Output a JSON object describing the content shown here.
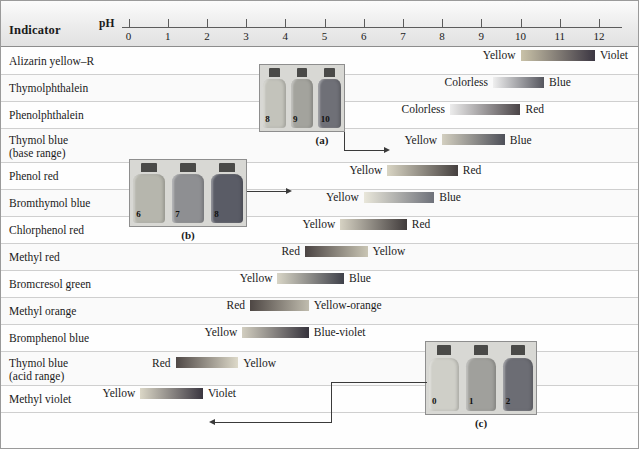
{
  "header": {
    "indicator_column_label": "Indicator",
    "ph_label": "pH"
  },
  "chart_data": {
    "type": "bar",
    "xlabel": "pH",
    "ylabel": "Indicator",
    "xlim": [
      0,
      12
    ],
    "grid": false,
    "legend": null,
    "axis_ticks": [
      "0",
      "1",
      "2",
      "3",
      "4",
      "5",
      "6",
      "7",
      "8",
      "9",
      "10",
      "11",
      "12"
    ],
    "categories": [
      "Alizarin yellow–R",
      "Thymolphthalein",
      "Phenolphthalein",
      "Thymol blue (base range)",
      "Phenol red",
      "Bromthymol blue",
      "Chlorphenol red",
      "Methyl red",
      "Bromcresol green",
      "Methyl orange",
      "Bromphenol blue",
      "Thymol blue (acid range)",
      "Methyl violet"
    ],
    "series": [
      {
        "name": "transition range",
        "ranges": [
          {
            "indicator": "Alizarin yellow–R",
            "ph_low": 10.0,
            "ph_high": 11.9,
            "acid_color": "Yellow",
            "base_color": "Violet"
          },
          {
            "indicator": "Thymolphthalein",
            "ph_low": 9.3,
            "ph_high": 10.6,
            "acid_color": "Colorless",
            "base_color": "Blue"
          },
          {
            "indicator": "Phenolphthalein",
            "ph_low": 8.2,
            "ph_high": 10.0,
            "acid_color": "Colorless",
            "base_color": "Red"
          },
          {
            "indicator": "Thymol blue (base range)",
            "ph_low": 8.0,
            "ph_high": 9.6,
            "acid_color": "Yellow",
            "base_color": "Blue"
          },
          {
            "indicator": "Phenol red",
            "ph_low": 6.6,
            "ph_high": 8.4,
            "acid_color": "Yellow",
            "base_color": "Red"
          },
          {
            "indicator": "Bromthymol blue",
            "ph_low": 6.0,
            "ph_high": 7.8,
            "acid_color": "Yellow",
            "base_color": "Blue"
          },
          {
            "indicator": "Chlorphenol red",
            "ph_low": 5.4,
            "ph_high": 7.1,
            "acid_color": "Yellow",
            "base_color": "Red"
          },
          {
            "indicator": "Methyl red",
            "ph_low": 4.5,
            "ph_high": 6.1,
            "acid_color": "Red",
            "base_color": "Yellow"
          },
          {
            "indicator": "Bromcresol green",
            "ph_low": 3.8,
            "ph_high": 5.5,
            "acid_color": "Yellow",
            "base_color": "Blue"
          },
          {
            "indicator": "Methyl orange",
            "ph_low": 3.1,
            "ph_high": 4.6,
            "acid_color": "Red",
            "base_color": "Yellow-orange"
          },
          {
            "indicator": "Bromphenol blue",
            "ph_low": 2.9,
            "ph_high": 4.6,
            "acid_color": "Yellow",
            "base_color": "Blue-violet"
          },
          {
            "indicator": "Thymol blue (acid range)",
            "ph_low": 1.2,
            "ph_high": 2.8,
            "acid_color": "Red",
            "base_color": "Yellow"
          },
          {
            "indicator": "Methyl violet",
            "ph_low": 0.3,
            "ph_high": 1.9,
            "acid_color": "Yellow",
            "base_color": "Violet"
          }
        ]
      }
    ]
  },
  "rows": [
    {
      "name": "Alizarin yellow–R",
      "name2": "",
      "left_label": "Yellow",
      "right_label": "Violet",
      "low": 10.0,
      "high": 11.9,
      "c1": "#c9c2a8",
      "c2": "#3b3642"
    },
    {
      "name": "Thymolphthalein",
      "name2": "",
      "left_label": "Colorless",
      "right_label": "Blue",
      "low": 9.3,
      "high": 10.6,
      "c1": "#efefef",
      "c2": "#55565e"
    },
    {
      "name": "Phenolphthalein",
      "name2": "",
      "left_label": "Colorless",
      "right_label": "Red",
      "low": 8.2,
      "high": 10.0,
      "c1": "#ececec",
      "c2": "#4a4447"
    },
    {
      "name": "Thymol blue",
      "name2": "(base range)",
      "left_label": "Yellow",
      "right_label": "Blue",
      "low": 8.0,
      "high": 9.6,
      "c1": "#d3cfc0",
      "c2": "#4e5059"
    },
    {
      "name": "Phenol red",
      "name2": "",
      "left_label": "Yellow",
      "right_label": "Red",
      "low": 6.6,
      "high": 8.4,
      "c1": "#d9d5c4",
      "c2": "#45403f"
    },
    {
      "name": "Bromthymol blue",
      "name2": "",
      "left_label": "Yellow",
      "right_label": "Blue",
      "low": 6.0,
      "high": 7.8,
      "c1": "#e9e7da",
      "c2": "#6e717a"
    },
    {
      "name": "Chlorphenol red",
      "name2": "",
      "left_label": "Yellow",
      "right_label": "Red",
      "low": 5.4,
      "high": 7.1,
      "c1": "#d6d2c3",
      "c2": "#403b3b"
    },
    {
      "name": "Methyl red",
      "name2": "",
      "left_label": "Red",
      "right_label": "Yellow",
      "low": 4.5,
      "high": 6.1,
      "c1": "#4b4443",
      "c2": "#c9c5b4"
    },
    {
      "name": "Bromcresol green",
      "name2": "",
      "left_label": "Yellow",
      "right_label": "Blue",
      "low": 3.8,
      "high": 5.5,
      "c1": "#d8d5c6",
      "c2": "#3f414a"
    },
    {
      "name": "Methyl orange",
      "name2": "",
      "left_label": "Red",
      "right_label": "Yellow-orange",
      "low": 3.1,
      "high": 4.6,
      "c1": "#4e4744",
      "c2": "#c0bcae"
    },
    {
      "name": "Bromphenol blue",
      "name2": "",
      "left_label": "Yellow",
      "right_label": "Blue-violet",
      "low": 2.9,
      "high": 4.6,
      "c1": "#d2cec0",
      "c2": "#36333c"
    },
    {
      "name": "Thymol blue",
      "name2": "(acid range)",
      "left_label": "Red",
      "right_label": "Yellow",
      "low": 1.2,
      "high": 2.8,
      "c1": "#4f4846",
      "c2": "#ddd9c9"
    },
    {
      "name": "Methyl violet",
      "name2": "",
      "left_label": "Yellow",
      "right_label": "Violet",
      "low": 0.3,
      "high": 1.9,
      "c1": "#dbd7c7",
      "c2": "#3a3640"
    }
  ],
  "insets": [
    {
      "caption": "(a)",
      "bottles": [
        {
          "label": "8",
          "color": "#c3c3bb"
        },
        {
          "label": "9",
          "color": "#a3a39d"
        },
        {
          "label": "10",
          "color": "#6f7077"
        }
      ]
    },
    {
      "caption": "(b)",
      "bottles": [
        {
          "label": "6",
          "color": "#b6b6ad"
        },
        {
          "label": "7",
          "color": "#8e8f92"
        },
        {
          "label": "8",
          "color": "#5a5c66"
        }
      ]
    },
    {
      "caption": "(c)",
      "bottles": [
        {
          "label": "0",
          "color": "#cfcfc8"
        },
        {
          "label": "1",
          "color": "#a0a09c"
        },
        {
          "label": "2",
          "color": "#6c6d74"
        }
      ]
    }
  ]
}
